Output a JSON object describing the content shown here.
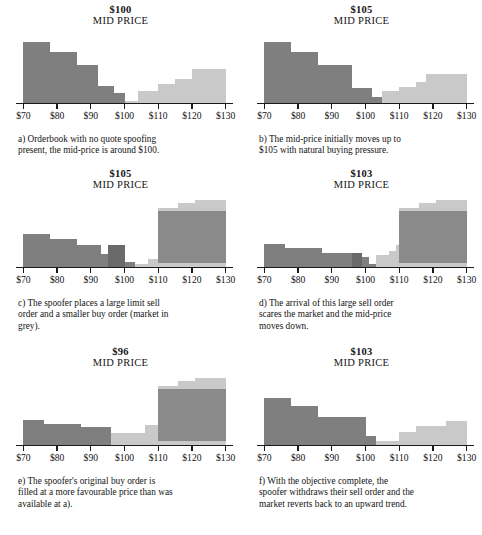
{
  "figure": {
    "colors": {
      "bid_dark": "#7f7f7f",
      "bid_darker": "#6a6a6a",
      "ask_light": "#c9c9c9",
      "spoof_block": "#8a8a8a",
      "axis": "#1a1a1a",
      "background": "#ffffff",
      "text": "#141414"
    },
    "axis": {
      "tick_labels": [
        "$70",
        "$80",
        "$90",
        "$100",
        "$110",
        "$120",
        "$130"
      ],
      "tick_values": [
        70,
        80,
        90,
        100,
        110,
        120,
        130
      ],
      "xmin": 69,
      "xmax": 131
    }
  },
  "chart_data": [
    {
      "id": "a",
      "type": "bar",
      "title": "$100",
      "subtitle": "MID PRICE",
      "mid_price": 100,
      "xlabel": "",
      "ylabel": "",
      "xlim": [
        69,
        131
      ],
      "ylim": [
        0,
        60
      ],
      "grid": false,
      "legend": "none",
      "caption": "a) Orderbook with no quote spoofing present, the mid-price is around $100.",
      "caption_lines": [
        "a) Orderbook with no quote spoofing",
        "present, the mid-price is around $100."
      ],
      "series": [
        {
          "name": "bid",
          "side": "bid",
          "color": "#7f7f7f",
          "bars": [
            {
              "x0": 70,
              "x1": 78,
              "height": 52
            },
            {
              "x0": 78,
              "x1": 86,
              "height": 44
            },
            {
              "x0": 86,
              "x1": 92,
              "height": 33
            },
            {
              "x0": 92,
              "x1": 97,
              "height": 15
            },
            {
              "x0": 97,
              "x1": 100,
              "height": 9
            }
          ]
        },
        {
          "name": "ask",
          "side": "ask",
          "color": "#c9c9c9",
          "bars": [
            {
              "x0": 100,
              "x1": 104,
              "height": 2
            },
            {
              "x0": 104,
              "x1": 110,
              "height": 10
            },
            {
              "x0": 110,
              "x1": 115,
              "height": 16
            },
            {
              "x0": 115,
              "x1": 120,
              "height": 21
            },
            {
              "x0": 120,
              "x1": 130,
              "height": 29
            }
          ]
        }
      ]
    },
    {
      "id": "b",
      "type": "bar",
      "title": "$105",
      "subtitle": "MID PRICE",
      "mid_price": 105,
      "xlabel": "",
      "ylabel": "",
      "xlim": [
        69,
        131
      ],
      "ylim": [
        0,
        60
      ],
      "grid": false,
      "legend": "none",
      "caption": "b) The mid-price initially moves up to $105 with natural buying pressure.",
      "caption_lines": [
        "b) The mid-price initially moves up to",
        "$105 with natural buying pressure."
      ],
      "series": [
        {
          "name": "bid",
          "side": "bid",
          "color": "#7f7f7f",
          "bars": [
            {
              "x0": 70,
              "x1": 78,
              "height": 52
            },
            {
              "x0": 78,
              "x1": 86,
              "height": 44
            },
            {
              "x0": 86,
              "x1": 96,
              "height": 33
            },
            {
              "x0": 96,
              "x1": 102,
              "height": 13
            },
            {
              "x0": 102,
              "x1": 105,
              "height": 5
            }
          ]
        },
        {
          "name": "ask",
          "side": "ask",
          "color": "#c9c9c9",
          "bars": [
            {
              "x0": 105,
              "x1": 110,
              "height": 10
            },
            {
              "x0": 110,
              "x1": 115,
              "height": 14
            },
            {
              "x0": 115,
              "x1": 118,
              "height": 18
            },
            {
              "x0": 118,
              "x1": 130,
              "height": 25
            }
          ]
        }
      ]
    },
    {
      "id": "c",
      "type": "bar",
      "title": "$105",
      "subtitle": "MID PRICE",
      "mid_price": 105,
      "xlabel": "",
      "ylabel": "",
      "xlim": [
        69,
        131
      ],
      "ylim": [
        0,
        78
      ],
      "grid": false,
      "legend": "none",
      "caption": "c) The spoofer places a large limit sell order and a smaller buy order (market in grey).",
      "caption_lines": [
        "c) The spoofer places a large limit sell",
        "order and a smaller buy order (market in",
        "grey)."
      ],
      "series": [
        {
          "name": "bid",
          "side": "bid",
          "color": "#7f7f7f",
          "bars": [
            {
              "x0": 70,
              "x1": 78,
              "height": 37
            },
            {
              "x0": 78,
              "x1": 86,
              "height": 31
            },
            {
              "x0": 86,
              "x1": 93,
              "height": 24
            },
            {
              "x0": 93,
              "x1": 100,
              "height": 15
            },
            {
              "x0": 100,
              "x1": 103,
              "height": 6
            }
          ]
        },
        {
          "name": "spoof-buy",
          "side": "bid",
          "color": "#6a6a6a",
          "bars": [
            {
              "x0": 95,
              "x1": 100,
              "height": 24
            }
          ]
        },
        {
          "name": "ask",
          "side": "ask",
          "color": "#c9c9c9",
          "bars": [
            {
              "x0": 103,
              "x1": 107,
              "height": 3
            },
            {
              "x0": 107,
              "x1": 110,
              "height": 9
            },
            {
              "x0": 110,
              "x1": 116,
              "height": 66
            },
            {
              "x0": 116,
              "x1": 121,
              "height": 71
            },
            {
              "x0": 121,
              "x1": 130,
              "height": 75
            }
          ]
        },
        {
          "name": "spoof-sell",
          "side": "ask",
          "color": "#8a8a8a",
          "bars": [
            {
              "x0": 110,
              "x1": 130,
              "y0": 5,
              "y1": 62
            }
          ]
        }
      ]
    },
    {
      "id": "d",
      "type": "bar",
      "title": "$103",
      "subtitle": "MID PRICE",
      "mid_price": 103,
      "xlabel": "",
      "ylabel": "",
      "xlim": [
        69,
        131
      ],
      "ylim": [
        0,
        78
      ],
      "grid": false,
      "legend": "none",
      "caption": "d) The arrival of this large sell order scares the market and the mid-price moves down.",
      "caption_lines": [
        "d) The arrival of this large sell order",
        "scares the market and the mid-price",
        "moves down."
      ],
      "series": [
        {
          "name": "bid",
          "side": "bid",
          "color": "#7f7f7f",
          "bars": [
            {
              "x0": 70,
              "x1": 76,
              "height": 26
            },
            {
              "x0": 76,
              "x1": 87,
              "height": 21
            },
            {
              "x0": 87,
              "x1": 96,
              "height": 16
            },
            {
              "x0": 96,
              "x1": 101,
              "height": 11
            },
            {
              "x0": 101,
              "x1": 103,
              "height": 3
            }
          ]
        },
        {
          "name": "spoof-buy",
          "side": "bid",
          "color": "#6a6a6a",
          "bars": [
            {
              "x0": 96,
              "x1": 99,
              "height": 16
            }
          ]
        },
        {
          "name": "ask",
          "side": "ask",
          "color": "#c9c9c9",
          "bars": [
            {
              "x0": 103,
              "x1": 107,
              "height": 13
            },
            {
              "x0": 107,
              "x1": 109,
              "height": 18
            },
            {
              "x0": 109,
              "x1": 110,
              "height": 24
            },
            {
              "x0": 110,
              "x1": 116,
              "height": 66
            },
            {
              "x0": 116,
              "x1": 121,
              "height": 71
            },
            {
              "x0": 121,
              "x1": 130,
              "height": 75
            }
          ]
        },
        {
          "name": "spoof-sell",
          "side": "ask",
          "color": "#8a8a8a",
          "bars": [
            {
              "x0": 110,
              "x1": 130,
              "y0": 5,
              "y1": 62
            }
          ]
        }
      ]
    },
    {
      "id": "e",
      "type": "bar",
      "title": "$96",
      "subtitle": "MID PRICE",
      "mid_price": 96,
      "xlabel": "",
      "ylabel": "",
      "xlim": [
        69,
        131
      ],
      "ylim": [
        0,
        78
      ],
      "grid": false,
      "legend": "none",
      "caption": "e) The spoofer's original buy order is filled at a more favourable price than was available at a).",
      "caption_lines": [
        "e) The spoofer's original buy order is",
        "filled at a more favourable price than was",
        "available at a)."
      ],
      "series": [
        {
          "name": "bid",
          "side": "bid",
          "color": "#7f7f7f",
          "bars": [
            {
              "x0": 70,
              "x1": 76,
              "height": 28
            },
            {
              "x0": 76,
              "x1": 87,
              "height": 23
            },
            {
              "x0": 87,
              "x1": 96,
              "height": 20
            }
          ]
        },
        {
          "name": "ask",
          "side": "ask",
          "color": "#c9c9c9",
          "bars": [
            {
              "x0": 96,
              "x1": 106,
              "height": 13
            },
            {
              "x0": 106,
              "x1": 110,
              "height": 22
            },
            {
              "x0": 110,
              "x1": 116,
              "height": 66
            },
            {
              "x0": 116,
              "x1": 121,
              "height": 71
            },
            {
              "x0": 121,
              "x1": 130,
              "height": 75
            }
          ]
        },
        {
          "name": "spoof-sell",
          "side": "ask",
          "color": "#8a8a8a",
          "bars": [
            {
              "x0": 110,
              "x1": 130,
              "y0": 5,
              "y1": 62
            }
          ]
        }
      ]
    },
    {
      "id": "f",
      "type": "bar",
      "title": "$103",
      "subtitle": "MID PRICE",
      "mid_price": 103,
      "xlabel": "",
      "ylabel": "",
      "xlim": [
        69,
        131
      ],
      "ylim": [
        0,
        78
      ],
      "grid": false,
      "legend": "none",
      "caption": "f) With the objective complete, the spoofer withdraws their sell order and the market reverts back to an upward trend.",
      "caption_lines": [
        "f) With the objective complete, the",
        "spoofer withdraws their sell order and the",
        "market reverts back to an upward trend."
      ],
      "series": [
        {
          "name": "bid",
          "side": "bid",
          "color": "#7f7f7f",
          "bars": [
            {
              "x0": 70,
              "x1": 78,
              "height": 52
            },
            {
              "x0": 78,
              "x1": 86,
              "height": 44
            },
            {
              "x0": 86,
              "x1": 100,
              "height": 31
            },
            {
              "x0": 100,
              "x1": 103,
              "height": 10
            }
          ]
        },
        {
          "name": "ask",
          "side": "ask",
          "color": "#c9c9c9",
          "bars": [
            {
              "x0": 103,
              "x1": 110,
              "height": 5
            },
            {
              "x0": 110,
              "x1": 115,
              "height": 15
            },
            {
              "x0": 115,
              "x1": 124,
              "height": 21
            },
            {
              "x0": 124,
              "x1": 130,
              "height": 27
            }
          ]
        }
      ]
    }
  ]
}
